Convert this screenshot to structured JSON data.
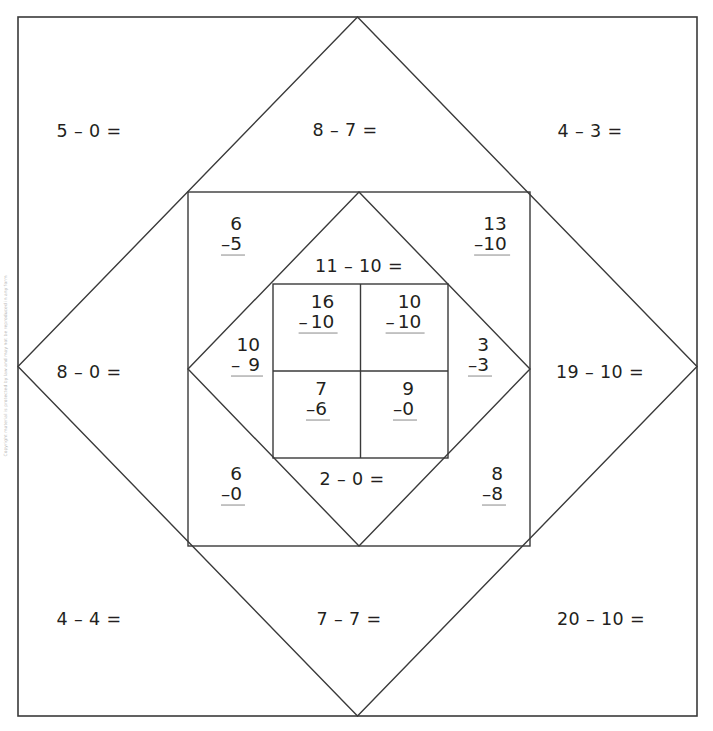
{
  "page": {
    "background_color": "#ffffff",
    "ink_color": "#231f20",
    "rule_color": "#8a8a8a",
    "width": 713,
    "height": 731,
    "margin_note": "Copyright material is protected by law and may not be reproduced in any form"
  },
  "outer_ring": {
    "name": "outer-square-corners",
    "problems": [
      {
        "id": "outer-tl",
        "text": "5 – 0 =",
        "corner": "top-left"
      },
      {
        "id": "outer-tr",
        "text": "4 – 3 =",
        "corner": "top-right"
      },
      {
        "id": "outer-bl",
        "text": "4 – 4 =",
        "corner": "bottom-left"
      },
      {
        "id": "outer-br",
        "text": "20 – 10 =",
        "corner": "bottom-right"
      }
    ]
  },
  "outer_diamond": {
    "name": "outer-diamond-edges",
    "problems": [
      {
        "id": "odia-top",
        "text": "8 – 7 =",
        "edge": "top"
      },
      {
        "id": "odia-left",
        "text": "8 – 0 =",
        "edge": "left"
      },
      {
        "id": "odia-right",
        "text": "19 – 10 =",
        "edge": "right"
      },
      {
        "id": "odia-bottom",
        "text": "7 – 7 =",
        "edge": "bottom"
      }
    ]
  },
  "middle_ring": {
    "name": "middle-square-corners",
    "problems": [
      {
        "id": "mid-tl",
        "corner": "top-left",
        "minuend": "6",
        "operator": "–",
        "subtrahend": "5"
      },
      {
        "id": "mid-tr",
        "corner": "top-right",
        "minuend": "13",
        "operator": "–",
        "subtrahend": "10"
      },
      {
        "id": "mid-bl",
        "corner": "bottom-left",
        "minuend": "6",
        "operator": "–",
        "subtrahend": "0"
      },
      {
        "id": "mid-br",
        "corner": "bottom-right",
        "minuend": "8",
        "operator": "–",
        "subtrahend": "8"
      }
    ]
  },
  "inner_diamond": {
    "name": "inner-diamond-edges",
    "problems": [
      {
        "id": "idia-top",
        "edge": "top",
        "text": "11 – 10 ="
      },
      {
        "id": "idia-bottom",
        "edge": "bottom",
        "text": "2 – 0 ="
      },
      {
        "id": "idia-left",
        "edge": "left",
        "minuend": "10",
        "operator": "–",
        "subtrahend": "9"
      },
      {
        "id": "idia-right",
        "edge": "right",
        "minuend": "3",
        "operator": "–",
        "subtrahend": "3"
      }
    ]
  },
  "inner_grid": {
    "name": "inner-square-quadrants",
    "problems": [
      {
        "id": "in-tl",
        "quadrant": "top-left",
        "minuend": "16",
        "operator": "–",
        "subtrahend": "10"
      },
      {
        "id": "in-tr",
        "quadrant": "top-right",
        "minuend": "10",
        "operator": "–",
        "subtrahend": "10"
      },
      {
        "id": "in-bl",
        "quadrant": "bottom-left",
        "minuend": "7",
        "operator": "–",
        "subtrahend": "6"
      },
      {
        "id": "in-br",
        "quadrant": "bottom-right",
        "minuend": "9",
        "operator": "–",
        "subtrahend": "0"
      }
    ]
  }
}
